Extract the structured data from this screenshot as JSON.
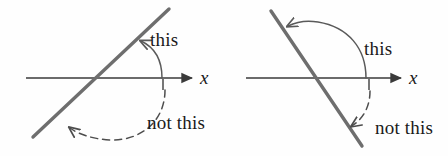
{
  "figure": {
    "background_color": "#fefefe",
    "line_color": "#6e6e6e",
    "axis_color": "#3a3a3a",
    "arc_color": "#5a5a5a",
    "text_color": "#1a1a1a",
    "panels": [
      {
        "id": "left",
        "description": "Line with positive slope crossing the x-axis; counterclockwise angle from the positive x-axis is labelled 'this', the clockwise reflex sweep is labelled 'not this'.",
        "axis_label": "x",
        "correct_angle_label": "this",
        "incorrect_angle_label": "not this",
        "correct_arc_style": "solid",
        "incorrect_arc_style": "dashed",
        "line_slope": "positive"
      },
      {
        "id": "right",
        "description": "Line with negative slope crossing the x-axis; counterclockwise obtuse angle from the positive x-axis is labelled 'this', the clockwise sweep is labelled 'not this'.",
        "axis_label": "x",
        "correct_angle_label": "this",
        "incorrect_angle_label": "not this",
        "correct_arc_style": "solid",
        "incorrect_arc_style": "dashed",
        "line_slope": "negative"
      }
    ]
  }
}
